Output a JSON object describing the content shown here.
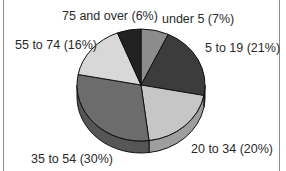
{
  "chart_data": {
    "type": "pie",
    "style": "3d",
    "title": "",
    "categories": [
      "under 5",
      "5 to 19",
      "20 to 34",
      "35 to 54",
      "55 to 74",
      "75 and over"
    ],
    "values": [
      7,
      21,
      20,
      30,
      16,
      6
    ],
    "unit": "%",
    "labels": [
      "under 5 (7%)",
      "5 to 19 (21%)",
      "20 to 34 (20%)",
      "35 to 54 (30%)",
      "55 to 74 (16%)",
      "75 and over (6%)"
    ],
    "colors": [
      "#8c8c8c",
      "#3c3c3c",
      "#c6c6c6",
      "#6c6c6c",
      "#d8d8d8",
      "#222222"
    ],
    "start_angle": "12 o'clock",
    "direction": "clockwise",
    "legend": "none (inline labels)"
  }
}
